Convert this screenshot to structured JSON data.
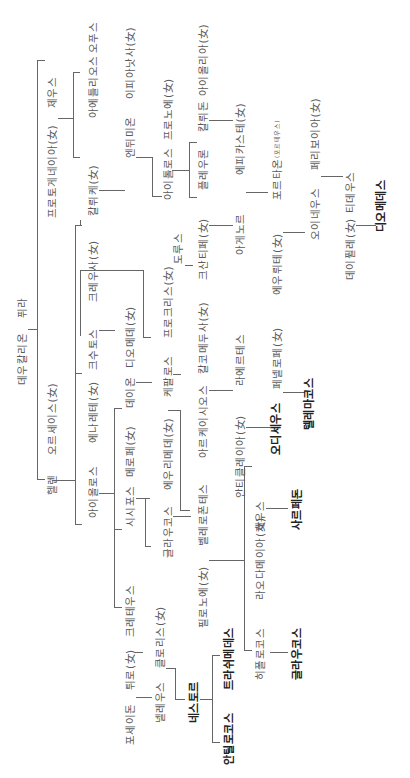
{
  "diagram": {
    "title": "",
    "orientation": "rotated-90-ccw",
    "nodes": [
      {
        "id": "deucalion",
        "label": "데우칼리온",
        "x": 22,
        "y": 385
      },
      {
        "id": "pyrrha",
        "label": "퓌라",
        "x": 22,
        "y": 318
      },
      {
        "id": "protogeneia",
        "label": "프로토게네이아(女)",
        "x": 52,
        "y": 218
      },
      {
        "id": "zeus1",
        "label": "제우스",
        "x": 52,
        "y": 108
      },
      {
        "id": "aethlios",
        "label": "아에틀리오스",
        "x": 93,
        "y": 118
      },
      {
        "id": "opus",
        "label": "오푸스",
        "x": 93,
        "y": 53
      },
      {
        "id": "hellen",
        "label": "헬렌",
        "x": 52,
        "y": 495
      },
      {
        "id": "orseis",
        "label": "오르세이스(女)",
        "x": 52,
        "y": 455
      },
      {
        "id": "kalyke",
        "label": "칼뤼케(女)",
        "x": 93,
        "y": 216
      },
      {
        "id": "endymion",
        "label": "엔뒤미온",
        "x": 130,
        "y": 158
      },
      {
        "id": "iphianassa",
        "label": "이피아낫사(女)",
        "x": 130,
        "y": 99
      },
      {
        "id": "xouthos",
        "label": "크수토스",
        "x": 93,
        "y": 370
      },
      {
        "id": "kreousa",
        "label": "크레우사(女)",
        "x": 93,
        "y": 302
      },
      {
        "id": "aiolos",
        "label": "아이올로스",
        "x": 93,
        "y": 518
      },
      {
        "id": "enarete",
        "label": "에나레테(女)",
        "x": 93,
        "y": 443
      },
      {
        "id": "aitolos",
        "label": "아이톨로스",
        "x": 168,
        "y": 200
      },
      {
        "id": "pronoe",
        "label": "프로노에(女)",
        "x": 168,
        "y": 140
      },
      {
        "id": "pleuron",
        "label": "플레우론",
        "x": 203,
        "y": 190
      },
      {
        "id": "kalydon",
        "label": "칼뤼돈",
        "x": 203,
        "y": 132
      },
      {
        "id": "aiolia",
        "label": "아이올리아(女)",
        "x": 203,
        "y": 96
      },
      {
        "id": "doros",
        "label": "도루스",
        "x": 178,
        "y": 264
      },
      {
        "id": "xanthippe",
        "label": "크산티페(女)",
        "x": 203,
        "y": 280
      },
      {
        "id": "agenor",
        "label": "아게노르",
        "x": 240,
        "y": 255
      },
      {
        "id": "epikaste",
        "label": "에피카스테(女)",
        "x": 240,
        "y": 175
      },
      {
        "id": "euryte",
        "label": "에우뤼테(女)",
        "x": 277,
        "y": 295
      },
      {
        "id": "porthaon",
        "label": "포르타온",
        "x": 277,
        "y": 200
      },
      {
        "id": "portheus",
        "label": "(포르테우스)",
        "x": 277,
        "y": 158
      },
      {
        "id": "oineus",
        "label": "오이네우스",
        "x": 315,
        "y": 240
      },
      {
        "id": "periboia",
        "label": "페리보이아(女)",
        "x": 315,
        "y": 170
      },
      {
        "id": "deipyle",
        "label": "데이퓔레(女)",
        "x": 350,
        "y": 280
      },
      {
        "id": "tydeus",
        "label": "티데우스",
        "x": 350,
        "y": 213
      },
      {
        "id": "diomedes",
        "label": "디오메데스",
        "x": 382,
        "y": 232,
        "bold": true
      },
      {
        "id": "deion",
        "label": "데이온",
        "x": 130,
        "y": 408
      },
      {
        "id": "diomede",
        "label": "디오메데(女)",
        "x": 130,
        "y": 368
      },
      {
        "id": "kephalos",
        "label": "케팔로스",
        "x": 168,
        "y": 397
      },
      {
        "id": "prokris",
        "label": "프로크리스(女)",
        "x": 168,
        "y": 338
      },
      {
        "id": "arkeisios",
        "label": "아르케이시오스",
        "x": 203,
        "y": 458
      },
      {
        "id": "chalkomedousa",
        "label": "칼코메두사(女)",
        "x": 203,
        "y": 374
      },
      {
        "id": "laertes",
        "label": "라에르테스",
        "x": 240,
        "y": 386
      },
      {
        "id": "antikleia",
        "label": "안티클레이아(女)",
        "x": 240,
        "y": 498
      },
      {
        "id": "odysseus",
        "label": "오디세우스",
        "x": 277,
        "y": 455,
        "bold": true
      },
      {
        "id": "penelope",
        "label": "페넬로페(女)",
        "x": 277,
        "y": 389
      },
      {
        "id": "telemachos",
        "label": "텔레마코스",
        "x": 310,
        "y": 430,
        "bold": true
      },
      {
        "id": "sisyphos",
        "label": "시시포스",
        "x": 130,
        "y": 527
      },
      {
        "id": "merope",
        "label": "메로페(女)",
        "x": 130,
        "y": 477
      },
      {
        "id": "glaukos",
        "label": "글라우코스",
        "x": 168,
        "y": 558
      },
      {
        "id": "eurymede",
        "label": "에우리메데(女)",
        "x": 168,
        "y": 490
      },
      {
        "id": "bellerophontes",
        "label": "벨레로폰테스",
        "x": 203,
        "y": 546
      },
      {
        "id": "philonoe",
        "label": "필로노에(女)",
        "x": 203,
        "y": 628
      },
      {
        "id": "laodameia",
        "label": "라오다메이아(女)",
        "x": 260,
        "y": 600
      },
      {
        "id": "zeus2",
        "label": "제우스",
        "x": 260,
        "y": 532
      },
      {
        "id": "sarpedon",
        "label": "사르페돈",
        "x": 298,
        "y": 530,
        "bold": true
      },
      {
        "id": "hippolochos",
        "label": "히폴로코스",
        "x": 260,
        "y": 680
      },
      {
        "id": "glaukos2",
        "label": "글라우코스",
        "x": 298,
        "y": 680,
        "bold": true
      },
      {
        "id": "kretheus",
        "label": "크레테우스",
        "x": 130,
        "y": 637
      },
      {
        "id": "tyro",
        "label": "튀로(女)",
        "x": 130,
        "y": 690
      },
      {
        "id": "poseidon",
        "label": "포세이돈",
        "x": 130,
        "y": 745
      },
      {
        "id": "pelias_neleus",
        "label": "넬레우스",
        "x": 160,
        "y": 723
      },
      {
        "id": "chloris",
        "label": "클로리스(女)",
        "x": 160,
        "y": 668
      },
      {
        "id": "nestor",
        "label": "네스토르",
        "x": 195,
        "y": 723,
        "bold": true
      },
      {
        "id": "antilochos",
        "label": "안틸로코스",
        "x": 230,
        "y": 765,
        "bold": true
      },
      {
        "id": "thrasymedes",
        "label": "트라쉬메데스",
        "x": 230,
        "y": 690,
        "bold": true
      }
    ]
  }
}
